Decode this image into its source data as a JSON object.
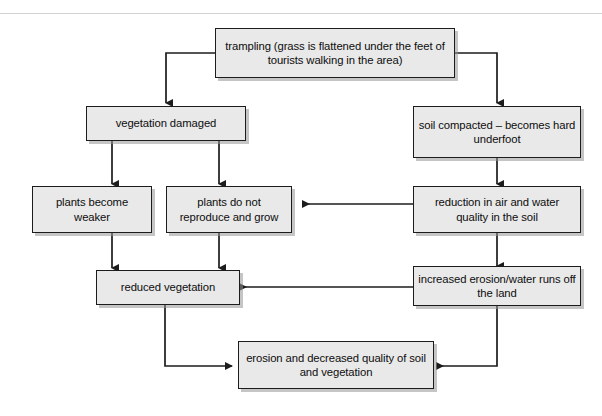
{
  "diagram": {
    "background_color": "#ffffff",
    "node_fill_color": "#e9e9e9",
    "node_border_color": "#1c1c1c",
    "connector_color": "#1c1c1c",
    "nodes": [
      {
        "id": "trampling",
        "text": "trampling (grass is flattened under the feet of tourists walking in the area)"
      },
      {
        "id": "vegetation-damaged",
        "text": "vegetation damaged"
      },
      {
        "id": "soil-compacted",
        "text": "soil compacted – becomes hard underfoot"
      },
      {
        "id": "plants-weaker",
        "text": "plants become weaker"
      },
      {
        "id": "plants-no-reproduce",
        "text": "plants do not reproduce and grow"
      },
      {
        "id": "air-water-quality",
        "text": "reduction in air and water quality in the soil"
      },
      {
        "id": "reduced-vegetation",
        "text": "reduced vegetation"
      },
      {
        "id": "increased-erosion",
        "text": "increased erosion/water runs off the land"
      },
      {
        "id": "erosion-decreased-quality",
        "text": "erosion and decreased quality of soil and vegetation"
      }
    ]
  }
}
